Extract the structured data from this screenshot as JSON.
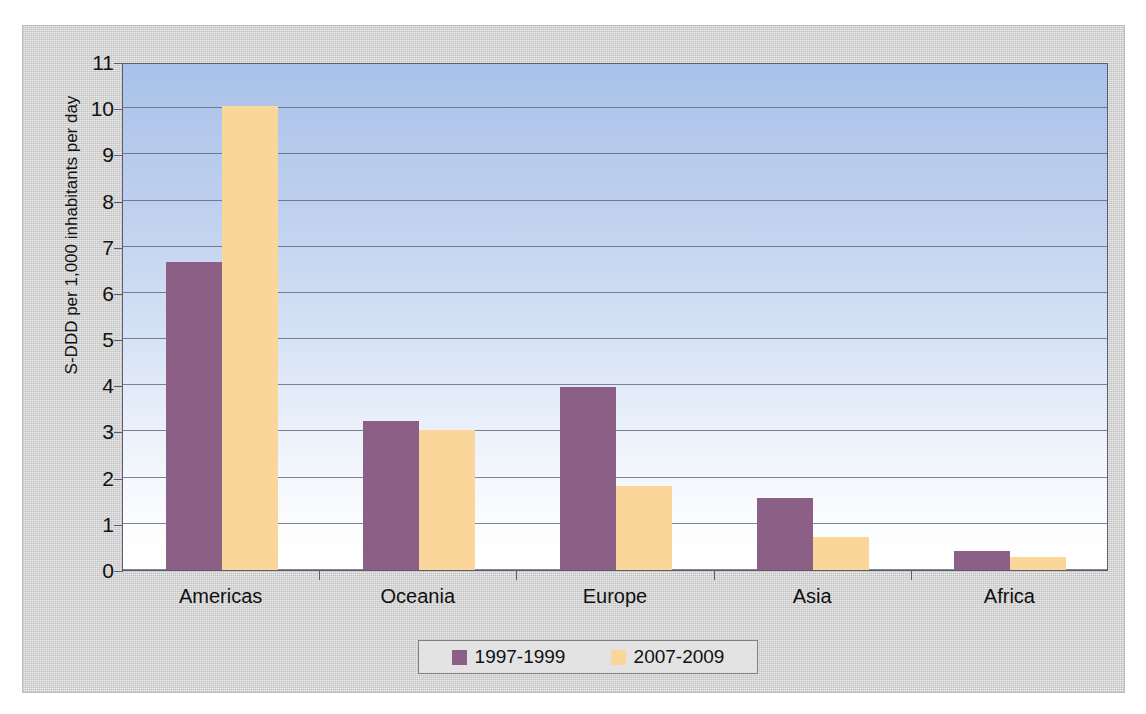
{
  "chart_data": {
    "type": "bar",
    "title": "",
    "subtitle": "",
    "xlabel": "",
    "ylabel": "S-DDD per 1,000 inhabitants per day",
    "ylim": [
      0,
      11
    ],
    "ytick_step": 1,
    "yticks": [
      11,
      10,
      9,
      8,
      7,
      6,
      5,
      4,
      3,
      2,
      1,
      0
    ],
    "grid": true,
    "legend_position": "bottom",
    "categories": [
      "Americas",
      "Oceania",
      "Europe",
      "Asia",
      "Africa"
    ],
    "series": [
      {
        "name": "1997-1999",
        "color": "#8b5f86",
        "values": [
          6.67,
          3.22,
          3.96,
          1.55,
          0.42
        ]
      },
      {
        "name": "2007-2009",
        "color": "#fbd69b",
        "values": [
          10.05,
          3.03,
          1.82,
          0.72,
          0.28
        ]
      }
    ],
    "annotations": []
  },
  "colors": {
    "series1": "#8b5f86",
    "series2": "#fbd69b",
    "plot_gradient_top": "#a9c1e9",
    "plot_gradient_bottom": "#ffffff",
    "paper": "#cdcdcd",
    "axis": "#5b5b70"
  }
}
